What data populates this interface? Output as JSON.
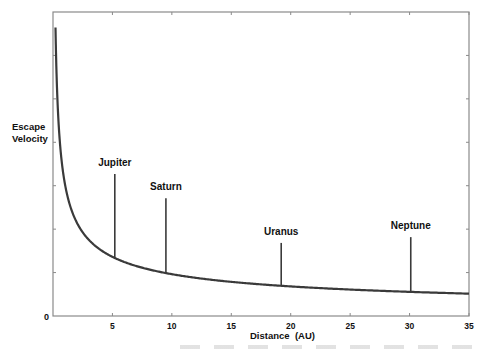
{
  "chart_data": {
    "type": "line",
    "title": "",
    "xlabel": "Distance  (AU)",
    "ylabel": "Escape Velocity",
    "xlim": [
      0,
      35
    ],
    "ylim": [
      0,
      null
    ],
    "x_ticks": [
      5,
      10,
      15,
      20,
      25,
      30,
      35
    ],
    "y_ticks": [
      "0"
    ],
    "grid": false,
    "curve": "Escape velocity falling off as 1/sqrt(distance) from the Sun",
    "series": [
      {
        "name": "Sun escape velocity",
        "x": [
          0.21,
          0.5,
          1,
          2,
          3,
          4,
          5.2,
          7,
          9.5,
          12,
          15,
          19.2,
          22,
          25,
          30.1,
          35
        ],
        "relative_values": [
          4.98,
          3.22,
          2.28,
          1.61,
          1.32,
          1.14,
          1.0,
          0.86,
          0.74,
          0.66,
          0.59,
          0.52,
          0.49,
          0.46,
          0.42,
          0.39
        ]
      }
    ],
    "annotations": [
      {
        "label": "Jupiter",
        "x": 5.2,
        "spike_relative_height": 2.45
      },
      {
        "label": "Saturn",
        "x": 9.5,
        "spike_relative_height": 2.03
      },
      {
        "label": "Uranus",
        "x": 19.2,
        "spike_relative_height": 1.26
      },
      {
        "label": "Neptune",
        "x": 30.1,
        "spike_relative_height": 1.36
      }
    ]
  },
  "axis": {
    "y_label_line1": "Escape",
    "y_label_line2": "Velocity",
    "origin_label": "0",
    "x_label": "Distance  (AU)",
    "x_tick_labels": [
      "5",
      "10",
      "15",
      "20",
      "25",
      "30",
      "35"
    ]
  },
  "planets": [
    {
      "name": "Jupiter",
      "au": 5.2
    },
    {
      "name": "Saturn",
      "au": 9.5
    },
    {
      "name": "Uranus",
      "au": 19.2
    },
    {
      "name": "Neptune",
      "au": 30.1
    }
  ],
  "colors": {
    "frame": "#8a8a8a",
    "curve": "#3a3a3a",
    "text": "#111111"
  }
}
